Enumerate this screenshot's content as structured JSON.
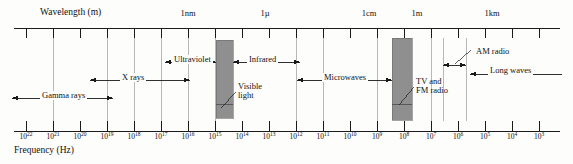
{
  "figure": {
    "kind": "electromagnetic-spectrum-diagram",
    "background": "#fdfdfb",
    "ink": "#1a1a1a",
    "band_fill": "#8f8f8f"
  },
  "axes": {
    "top": {
      "title": "Wavelength (m)",
      "title_x": 40,
      "title_y": 8,
      "line_y": 28,
      "line_x1": 14,
      "line_x2": 560,
      "scale_labels": [
        {
          "text": "1nm",
          "x": 188
        },
        {
          "text": "1µ",
          "x": 265
        },
        {
          "text": "1cm",
          "x": 369
        },
        {
          "text": "1m",
          "x": 417
        },
        {
          "text": "1km",
          "x": 492
        }
      ]
    },
    "bottom": {
      "title": "Frequency (Hz)",
      "title_x": 14,
      "title_y": 148,
      "line_y": 131,
      "line_x1": 14,
      "line_x2": 560,
      "tick_labels": [
        {
          "base": "10",
          "exp": "22",
          "x": 26
        },
        {
          "base": "10",
          "exp": "21",
          "x": 53
        },
        {
          "base": "10",
          "exp": "20",
          "x": 80
        },
        {
          "base": "10",
          "exp": "19",
          "x": 107
        },
        {
          "base": "10",
          "exp": "18",
          "x": 134
        },
        {
          "base": "10",
          "exp": "17",
          "x": 161
        },
        {
          "base": "10",
          "exp": "16",
          "x": 188
        },
        {
          "base": "10",
          "exp": "15",
          "x": 215
        },
        {
          "base": "10",
          "exp": "14",
          "x": 242
        },
        {
          "base": "10",
          "exp": "13",
          "x": 269
        },
        {
          "base": "10",
          "exp": "12",
          "x": 296
        },
        {
          "base": "10",
          "exp": "11",
          "x": 323
        },
        {
          "base": "10",
          "exp": "10",
          "x": 350
        },
        {
          "base": "10",
          "exp": "9",
          "x": 377
        },
        {
          "base": "10",
          "exp": "8",
          "x": 404
        },
        {
          "base": "10",
          "exp": "7",
          "x": 431
        },
        {
          "base": "10",
          "exp": "6",
          "x": 458
        },
        {
          "base": "10",
          "exp": "5",
          "x": 485
        },
        {
          "base": "10",
          "exp": "4",
          "x": 512
        },
        {
          "base": "10",
          "exp": "3",
          "x": 539
        }
      ]
    }
  },
  "bands": [
    {
      "name": "gamma-rays",
      "label": "Gamma rays",
      "label_x": 40,
      "label_y": 91,
      "arrow_y": 98,
      "x1": 12,
      "x2": 113,
      "arrow_left": true,
      "arrow_right": true
    },
    {
      "name": "x-rays",
      "label": "X rays",
      "label_x": 120,
      "label_y": 73,
      "arrow_y": 80,
      "x1": 90,
      "x2": 190,
      "arrow_left": true,
      "arrow_right": true
    },
    {
      "name": "ultraviolet",
      "label": "Ultraviolet",
      "label_x": 172,
      "label_y": 55,
      "arrow_y": 62,
      "x1": 165,
      "x2": 216,
      "arrow_left": true,
      "arrow_right": true
    },
    {
      "name": "infrared",
      "label": "Infrared",
      "label_x": 247,
      "label_y": 55,
      "arrow_y": 62,
      "x1": 233,
      "x2": 300,
      "arrow_left": true,
      "arrow_right": true
    },
    {
      "name": "microwaves",
      "label": "Microwaves",
      "label_x": 322,
      "label_y": 73,
      "arrow_y": 80,
      "x1": 297,
      "x2": 392,
      "arrow_left": true,
      "arrow_right": true
    },
    {
      "name": "am-radio",
      "label": "AM radio",
      "label_x": 474,
      "label_y": 47,
      "arrow_y": 65,
      "x1": 443,
      "x2": 466,
      "arrow_left": true,
      "arrow_right": true
    },
    {
      "name": "long-waves",
      "label": "Long waves",
      "label_x": 488,
      "label_y": 66,
      "arrow_y": 74,
      "x1": 470,
      "x2": 562,
      "arrow_left": true,
      "arrow_right": false
    }
  ],
  "highlight_bands": [
    {
      "name": "visible-light",
      "label_line1": "Visible",
      "label_line2": "light",
      "label_x": 238,
      "label_y": 82,
      "x": 216,
      "y": 40,
      "width": 17,
      "height": 78,
      "split_y": 104,
      "leader_x1": 236,
      "leader_y1": 92,
      "leader_x2": 221,
      "leader_y2": 108
    },
    {
      "name": "tv-and-fm-radio",
      "label_line1": "TV and",
      "label_line2": "FM radio",
      "label_x": 416,
      "label_y": 77,
      "x": 392,
      "y": 38,
      "width": 20,
      "height": 82,
      "split_y": 104,
      "leader_x1": 414,
      "leader_y1": 87,
      "leader_x2": 399,
      "leader_y2": 105
    }
  ],
  "ticks": {
    "top_major_y1": 28,
    "top_major_y2": 38,
    "top_minor_y1": 28,
    "top_minor_y2": 35,
    "bottom_y1": 121,
    "bottom_y2": 131,
    "drop_color": "#9a9a9a",
    "positions_x": [
      26,
      53,
      80,
      107,
      134,
      161,
      188,
      215,
      242,
      269,
      296,
      323,
      350,
      377,
      404,
      431,
      458,
      485,
      512,
      539
    ],
    "drop_lines": [
      {
        "x": 53,
        "y1": 38,
        "y2": 121
      },
      {
        "x": 107,
        "y1": 38,
        "y2": 121
      },
      {
        "x": 134,
        "y1": 38,
        "y2": 121
      },
      {
        "x": 161,
        "y1": 38,
        "y2": 121
      },
      {
        "x": 188,
        "y1": 38,
        "y2": 121
      },
      {
        "x": 215,
        "y1": 38,
        "y2": 121
      },
      {
        "x": 296,
        "y1": 38,
        "y2": 121
      },
      {
        "x": 323,
        "y1": 38,
        "y2": 121
      },
      {
        "x": 377,
        "y1": 38,
        "y2": 121
      },
      {
        "x": 431,
        "y1": 38,
        "y2": 121
      },
      {
        "x": 466,
        "y1": 38,
        "y2": 121
      },
      {
        "x": 443,
        "y1": 38,
        "y2": 121
      }
    ]
  }
}
